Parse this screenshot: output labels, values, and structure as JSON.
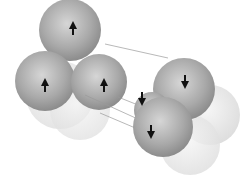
{
  "diagram": {
    "left_cluster": {
      "arrow_direction": "up",
      "visible_arrows": 3,
      "spheres": [
        {
          "cx": 70,
          "cy": 27,
          "r": 33,
          "arrow": "up",
          "ax": 73,
          "ay": 29
        },
        {
          "cx": 45,
          "cy": 80,
          "r": 29,
          "arrow": "up",
          "ax": 45,
          "ay": 84
        },
        {
          "cx": 95,
          "cy": 82,
          "r": 29,
          "arrow": "up",
          "ax": 104,
          "ay": 84
        }
      ]
    },
    "right_cluster": {
      "arrow_direction": "down",
      "visible_arrows": 3,
      "spheres": [
        {
          "cx": 186,
          "cy": 87,
          "r": 33,
          "arrow": "down",
          "ax": 185,
          "ay": 81
        },
        {
          "cx": 171,
          "cy": 128,
          "r": 32,
          "arrow": "down",
          "ax": 151,
          "ay": 97
        },
        {
          "cx": 171,
          "cy": 128,
          "r": 32,
          "arrow": "down",
          "ax": 152,
          "ay": 131
        }
      ]
    },
    "colors": {
      "sphere_dark": "#8a8a8a",
      "sphere_light": "#cfcfcf",
      "ghost": "#e8e8e8",
      "arrow": "#111111",
      "line": "#9a9a9a"
    }
  }
}
